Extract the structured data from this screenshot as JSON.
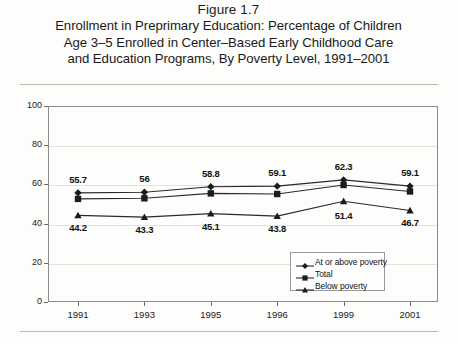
{
  "figure": {
    "number": "Figure 1.7",
    "title_lines": [
      "Enrollment in Preprimary Education: Percentage of Children",
      "Age 3–5 Enrolled in Center–Based Early Childhood Care",
      "and Education Programs, By Poverty Level, 1991–2001"
    ]
  },
  "chart_data": {
    "type": "line",
    "xlabel": "",
    "ylabel": "Percentage",
    "categories": [
      "1991",
      "1993",
      "1995",
      "1996",
      "1999",
      "2001"
    ],
    "x": [
      1991,
      1993,
      1995,
      1996,
      1999,
      2001
    ],
    "ylim": [
      0,
      100
    ],
    "yticks": [
      0,
      20,
      40,
      60,
      80,
      100
    ],
    "ytick_labels": [
      "0",
      "20",
      "40",
      "60",
      "80",
      "100"
    ],
    "grid": true,
    "legend_position": "bottom-right",
    "series": [
      {
        "name": "At or above poverty",
        "marker": "diamond",
        "values": [
          55.7,
          56,
          58.8,
          59.1,
          62.3,
          59.1
        ],
        "labels": [
          "55.7",
          "56",
          "58.8",
          "59.1",
          "62.3",
          "59.1"
        ],
        "labels_shown": true
      },
      {
        "name": "Total",
        "marker": "square",
        "values": [
          52.6,
          52.9,
          55.4,
          55.1,
          59.7,
          56.4
        ],
        "labels": [
          "",
          "",
          "",
          "",
          "",
          ""
        ],
        "labels_shown": false
      },
      {
        "name": "Below poverty",
        "marker": "triangle",
        "values": [
          44.2,
          43.3,
          45.1,
          43.8,
          51.4,
          46.7
        ],
        "labels": [
          "44.2",
          "43.3",
          "45.1",
          "43.8",
          "51.4",
          "46.7"
        ],
        "labels_shown": true
      }
    ]
  },
  "legend": {
    "items": [
      {
        "label": "At or above poverty",
        "marker": "diamond"
      },
      {
        "label": "Total",
        "marker": "square"
      },
      {
        "label": "Below poverty",
        "marker": "triangle"
      }
    ]
  }
}
